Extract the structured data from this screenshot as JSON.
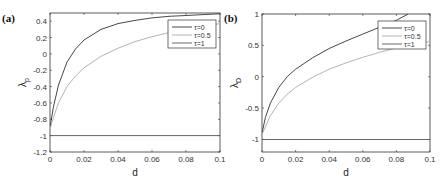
{
  "chart_data": [
    {
      "panel": "(a)",
      "type": "line",
      "xlabel": "d",
      "ylabel": "λ_p",
      "ylabel_main": "λ",
      "ylabel_sub": "p",
      "xlim": [
        0,
        0.1
      ],
      "ylim": [
        -1.2,
        0.5
      ],
      "xticks": [
        "0",
        "0.02",
        "0.04",
        "0.06",
        "0.08",
        "0.1"
      ],
      "yticks": [
        "0.4",
        "0.2",
        "0",
        "-0.2",
        "-0.4",
        "-0.6",
        "-0.8",
        "-1",
        "-1.2"
      ],
      "legend_position": "upper right",
      "series": [
        {
          "name": "τ=0",
          "color": "#333333",
          "x": [
            0,
            0.002,
            0.005,
            0.01,
            0.015,
            0.02,
            0.03,
            0.04,
            0.05,
            0.06,
            0.07,
            0.08,
            0.09,
            0.1
          ],
          "y": [
            -0.9,
            -0.65,
            -0.38,
            -0.1,
            0.06,
            0.17,
            0.3,
            0.37,
            0.41,
            0.44,
            0.46,
            0.47,
            0.48,
            0.49
          ]
        },
        {
          "name": "τ=0.5",
          "color": "#aaaaaa",
          "x": [
            0,
            0.002,
            0.005,
            0.01,
            0.015,
            0.02,
            0.03,
            0.04,
            0.05,
            0.06,
            0.07,
            0.08,
            0.09,
            0.1
          ],
          "y": [
            -0.92,
            -0.78,
            -0.6,
            -0.4,
            -0.27,
            -0.17,
            -0.03,
            0.07,
            0.15,
            0.21,
            0.26,
            0.3,
            0.34,
            0.37
          ]
        },
        {
          "name": "τ=1",
          "color": "#555555",
          "x": [
            0,
            0.1
          ],
          "y": [
            -1,
            -1
          ]
        }
      ]
    },
    {
      "panel": "(b)",
      "type": "line",
      "xlabel": "d",
      "ylabel": "λ_D",
      "ylabel_main": "λ",
      "ylabel_sub": "D",
      "xlim": [
        0,
        0.1
      ],
      "ylim": [
        -1.2,
        1
      ],
      "xticks": [
        "0",
        "0.02",
        "0.04",
        "0.06",
        "0.08",
        "0.1"
      ],
      "yticks": [
        "1",
        "0.5",
        "0",
        "-0.5",
        "-1"
      ],
      "legend_position": "upper right",
      "series": [
        {
          "name": "τ=0",
          "color": "#333333",
          "x": [
            0,
            0.002,
            0.005,
            0.01,
            0.015,
            0.02,
            0.03,
            0.04,
            0.05,
            0.06,
            0.07,
            0.08,
            0.087
          ],
          "y": [
            -0.9,
            -0.65,
            -0.42,
            -0.17,
            0.0,
            0.12,
            0.3,
            0.45,
            0.57,
            0.68,
            0.79,
            0.9,
            1.0
          ]
        },
        {
          "name": "τ=0.5",
          "color": "#aaaaaa",
          "x": [
            0,
            0.002,
            0.005,
            0.01,
            0.015,
            0.02,
            0.03,
            0.04,
            0.05,
            0.06,
            0.07,
            0.08,
            0.09,
            0.1
          ],
          "y": [
            -0.92,
            -0.8,
            -0.62,
            -0.42,
            -0.28,
            -0.17,
            -0.01,
            0.12,
            0.22,
            0.31,
            0.39,
            0.46,
            0.52,
            0.56
          ]
        },
        {
          "name": "τ=1",
          "color": "#555555",
          "x": [
            0,
            0.1
          ],
          "y": [
            -1,
            -1
          ]
        }
      ]
    }
  ]
}
